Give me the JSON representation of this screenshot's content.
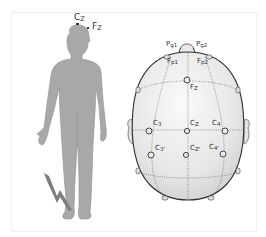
{
  "figure": {
    "body_panel": {
      "labels": [
        {
          "main": "C",
          "sub": "Z",
          "id": "cz"
        },
        {
          "main": "F",
          "sub": "Z",
          "id": "fz"
        }
      ],
      "icons": [
        "human-body-silhouette",
        "lightning-bolt-icon"
      ]
    },
    "head_panel": {
      "labels": [
        {
          "main": "P",
          "sub": "g1",
          "id": "pg1"
        },
        {
          "main": "P",
          "sub": "g2",
          "id": "pg2"
        },
        {
          "main": "F",
          "sub": "p1",
          "id": "fp1"
        },
        {
          "main": "F",
          "sub": "p2",
          "id": "fp2"
        },
        {
          "main": "F",
          "sub": "Z",
          "id": "fz"
        },
        {
          "main": "C",
          "sub": "3",
          "id": "c3"
        },
        {
          "main": "C",
          "sub": "Z",
          "id": "cz"
        },
        {
          "main": "C",
          "sub": "4",
          "id": "c4"
        },
        {
          "main": "C",
          "sub": "3'",
          "id": "c3p"
        },
        {
          "main": "C",
          "sub": "Z'",
          "id": "czp"
        },
        {
          "main": "C",
          "sub": "4'",
          "id": "c4p"
        }
      ]
    },
    "colors": {
      "body_fill": "#a6a6a6",
      "head_fill": "#ececec",
      "outline": "#3a3a3a",
      "grid_dots": "#555555"
    }
  }
}
